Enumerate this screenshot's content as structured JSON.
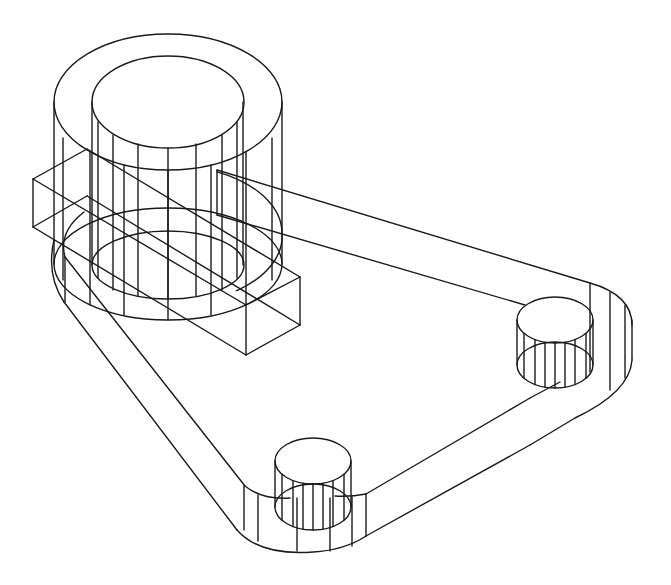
{
  "drawing": {
    "type": "isometric-wireframe",
    "stroke_color": "#1a1a1a",
    "background": "#ffffff",
    "parts": {
      "main_boss": {
        "outer_top": {
          "cx": 168,
          "cy": 102,
          "rx": 114,
          "ry": 68
        },
        "inner_top": {
          "cx": 168,
          "cy": 102,
          "rx": 76,
          "ry": 46
        },
        "outer_bottom": {
          "cx": 168,
          "cy": 264,
          "rx": 114,
          "ry": 56
        },
        "inner_bottom": {
          "cx": 168,
          "cy": 265,
          "rx": 76,
          "ry": 34
        },
        "outer_verticals": [
          [
            54,
            102,
            264
          ],
          [
            63,
            138,
            280
          ],
          [
            90,
            152,
            305
          ],
          [
            124,
            165,
            315
          ],
          [
            168,
            170,
            320
          ],
          [
            211,
            165,
            315
          ],
          [
            246,
            152,
            305
          ],
          [
            272,
            138,
            280
          ],
          [
            282,
            102,
            264
          ]
        ],
        "inner_verticals": [
          [
            92,
            102,
            265
          ],
          [
            98,
            122,
            278
          ],
          [
            113,
            135,
            290
          ],
          [
            138,
            144,
            296
          ],
          [
            168,
            148,
            299
          ],
          [
            196,
            144,
            296
          ],
          [
            222,
            135,
            290
          ],
          [
            237,
            122,
            278
          ],
          [
            243,
            102,
            265
          ]
        ]
      },
      "rect_bar": {
        "lines": [
          [
            33,
            179,
            246,
            305
          ],
          [
            33,
            227,
            246,
            355
          ],
          [
            87,
            149,
            300,
            277
          ],
          [
            87,
            196,
            300,
            325
          ],
          [
            33,
            179,
            33,
            227
          ],
          [
            246,
            305,
            246,
            355
          ],
          [
            300,
            277,
            300,
            325
          ],
          [
            33,
            179,
            87,
            149
          ],
          [
            33,
            227,
            87,
            196
          ],
          [
            246,
            305,
            300,
            277
          ],
          [
            246,
            355,
            300,
            325
          ]
        ]
      },
      "base_plate": {
        "lines": [
          [
            65,
            257,
            245,
            486
          ],
          [
            64,
            302,
            237,
            530
          ],
          [
            366,
            494,
            530,
            398
          ],
          [
            366,
            536,
            530,
            445
          ],
          [
            217,
            170,
            590,
            283
          ],
          [
            217,
            215,
            525,
            305
          ],
          [
            217,
            170,
            217,
            215
          ],
          [
            65,
            257,
            65,
            302
          ],
          [
            632,
            320,
            632,
            360
          ]
        ],
        "curves": [
          "M245,486 Q262,500 290,498",
          "M237,530 Q260,556 313,552 Q345,550 366,536",
          "M335,496 Q350,497 366,494",
          "M590,283 Q632,295 632,325",
          "M632,360 Q630,392 575,418 L530,445",
          "M530,398 L560,382",
          "M65,257 Q58,232 84,212",
          "M64,302 Q46,275 54,240"
        ],
        "arc_around_boss": {
          "cx": 168,
          "cy": 233,
          "rx": 114,
          "ry": 68
        },
        "bottom_corner_verticals": [
          [
            244,
            486,
            530
          ],
          [
            258,
            495,
            541
          ],
          [
            297,
            498,
            551
          ],
          [
            330,
            498,
            551
          ],
          [
            352,
            497,
            546
          ],
          [
            366,
            494,
            536
          ]
        ],
        "right_corner_verticals": [
          [
            590,
            283,
            372
          ],
          [
            610,
            292,
            390
          ],
          [
            625,
            305,
            378
          ]
        ]
      },
      "boss_bottom": {
        "top": {
          "cx": 313,
          "cy": 461,
          "rx": 38,
          "ry": 23
        },
        "bottom": {
          "cx": 313,
          "cy": 507,
          "rx": 38,
          "ry": 23
        },
        "verticals": [
          275,
          282,
          293,
          303,
          313,
          323,
          333,
          344,
          351
        ]
      },
      "boss_right": {
        "top": {
          "cx": 555,
          "cy": 320,
          "rx": 38,
          "ry": 23
        },
        "bottom": {
          "cx": 555,
          "cy": 365,
          "rx": 38,
          "ry": 23
        },
        "verticals": [
          517,
          524,
          535,
          545,
          555,
          565,
          575,
          586,
          593
        ]
      }
    }
  }
}
